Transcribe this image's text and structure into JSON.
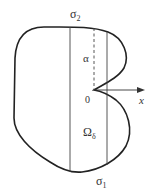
{
  "diagram": {
    "type": "domain-boundary-figure",
    "labels": {
      "sigma_top": "σ",
      "sigma_top_sub": "2",
      "sigma_bottom": "σ",
      "sigma_bottom_sub": "1",
      "alpha": "α",
      "origin": "0",
      "omega": "Ω",
      "omega_sub": "δ",
      "axis": "x"
    },
    "colors": {
      "stroke": "#222222",
      "text": "#333333",
      "background": "#ffffff"
    }
  }
}
